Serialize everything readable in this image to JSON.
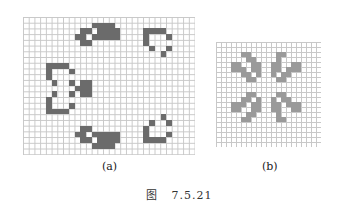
{
  "figure": {
    "caption": "图   7.5.21",
    "panels": [
      {
        "id": "a",
        "label": "(a)",
        "cols": 30,
        "rows": 24,
        "cell_color": "#6b6b6b",
        "grid_color": "#c8c8c8",
        "cells": [
          [
            12,
            1
          ],
          [
            13,
            1
          ],
          [
            14,
            1
          ],
          [
            15,
            1
          ],
          [
            10,
            2
          ],
          [
            11,
            2
          ],
          [
            13,
            2
          ],
          [
            14,
            2
          ],
          [
            15,
            2
          ],
          [
            16,
            2
          ],
          [
            9,
            3
          ],
          [
            10,
            3
          ],
          [
            12,
            3
          ],
          [
            13,
            3
          ],
          [
            14,
            3
          ],
          [
            15,
            3
          ],
          [
            16,
            3
          ],
          [
            10,
            4
          ],
          [
            11,
            4
          ],
          [
            21,
            2
          ],
          [
            22,
            2
          ],
          [
            23,
            2
          ],
          [
            24,
            2
          ],
          [
            21,
            3
          ],
          [
            25,
            3
          ],
          [
            21,
            4
          ],
          [
            22,
            5
          ],
          [
            25,
            5
          ],
          [
            24,
            6
          ],
          [
            4,
            8
          ],
          [
            5,
            8
          ],
          [
            6,
            8
          ],
          [
            7,
            8
          ],
          [
            4,
            9
          ],
          [
            8,
            9
          ],
          [
            4,
            10
          ],
          [
            5,
            11
          ],
          [
            8,
            11
          ],
          [
            10,
            11
          ],
          [
            11,
            11
          ],
          [
            9,
            12
          ],
          [
            10,
            12
          ],
          [
            11,
            12
          ],
          [
            5,
            13
          ],
          [
            8,
            13
          ],
          [
            10,
            13
          ],
          [
            11,
            13
          ],
          [
            4,
            14
          ],
          [
            4,
            15
          ],
          [
            8,
            15
          ],
          [
            4,
            16
          ],
          [
            5,
            16
          ],
          [
            6,
            16
          ],
          [
            7,
            16
          ],
          [
            24,
            17
          ],
          [
            22,
            18
          ],
          [
            25,
            18
          ],
          [
            21,
            19
          ],
          [
            21,
            20
          ],
          [
            25,
            20
          ],
          [
            21,
            21
          ],
          [
            22,
            21
          ],
          [
            23,
            21
          ],
          [
            24,
            21
          ],
          [
            10,
            19
          ],
          [
            11,
            19
          ],
          [
            9,
            20
          ],
          [
            10,
            20
          ],
          [
            12,
            20
          ],
          [
            13,
            20
          ],
          [
            14,
            20
          ],
          [
            15,
            20
          ],
          [
            16,
            20
          ],
          [
            10,
            21
          ],
          [
            11,
            21
          ],
          [
            13,
            21
          ],
          [
            14,
            21
          ],
          [
            15,
            21
          ],
          [
            16,
            21
          ],
          [
            12,
            22
          ],
          [
            13,
            22
          ],
          [
            14,
            22
          ],
          [
            15,
            22
          ]
        ]
      },
      {
        "id": "b",
        "label": "(b)",
        "cols": 21,
        "rows": 21,
        "cell_color": "#9a9a9a",
        "grid_color": "#c8c8c8",
        "cells": [
          [
            5,
            2
          ],
          [
            6,
            2
          ],
          [
            12,
            2
          ],
          [
            13,
            2
          ],
          [
            6,
            3
          ],
          [
            7,
            3
          ],
          [
            12,
            3
          ],
          [
            3,
            4
          ],
          [
            4,
            4
          ],
          [
            7,
            4
          ],
          [
            8,
            4
          ],
          [
            11,
            4
          ],
          [
            12,
            4
          ],
          [
            15,
            4
          ],
          [
            16,
            4
          ],
          [
            3,
            5
          ],
          [
            4,
            5
          ],
          [
            5,
            5
          ],
          [
            7,
            5
          ],
          [
            8,
            5
          ],
          [
            11,
            5
          ],
          [
            12,
            5
          ],
          [
            14,
            5
          ],
          [
            15,
            5
          ],
          [
            16,
            5
          ],
          [
            5,
            6
          ],
          [
            6,
            6
          ],
          [
            8,
            6
          ],
          [
            11,
            6
          ],
          [
            13,
            6
          ],
          [
            14,
            6
          ],
          [
            6,
            7
          ],
          [
            7,
            7
          ],
          [
            12,
            7
          ],
          [
            13,
            7
          ],
          [
            6,
            10
          ],
          [
            7,
            10
          ],
          [
            12,
            10
          ],
          [
            13,
            10
          ],
          [
            5,
            11
          ],
          [
            6,
            11
          ],
          [
            8,
            11
          ],
          [
            11,
            11
          ],
          [
            13,
            11
          ],
          [
            14,
            11
          ],
          [
            3,
            12
          ],
          [
            4,
            12
          ],
          [
            5,
            12
          ],
          [
            7,
            12
          ],
          [
            8,
            12
          ],
          [
            11,
            12
          ],
          [
            12,
            12
          ],
          [
            14,
            12
          ],
          [
            15,
            12
          ],
          [
            16,
            12
          ],
          [
            3,
            13
          ],
          [
            4,
            13
          ],
          [
            7,
            13
          ],
          [
            8,
            13
          ],
          [
            11,
            13
          ],
          [
            12,
            13
          ],
          [
            15,
            13
          ],
          [
            16,
            13
          ],
          [
            6,
            14
          ],
          [
            7,
            14
          ],
          [
            12,
            14
          ],
          [
            5,
            15
          ],
          [
            6,
            15
          ],
          [
            12,
            15
          ],
          [
            13,
            15
          ]
        ]
      }
    ]
  }
}
